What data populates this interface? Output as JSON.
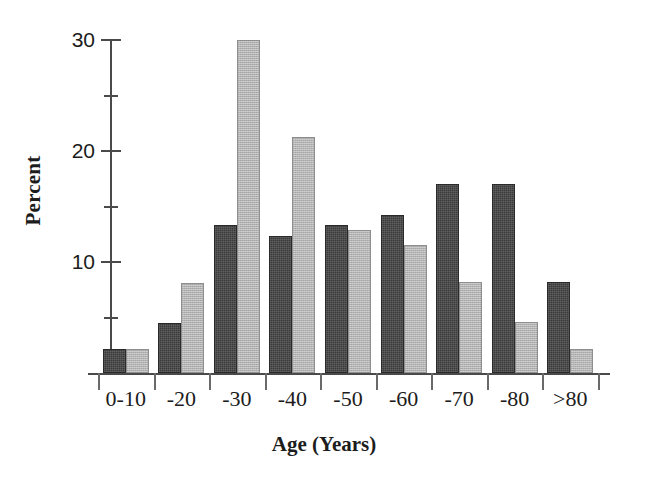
{
  "chart_data": {
    "type": "bar",
    "title": "",
    "xlabel": "Age (Years)",
    "ylabel": "Percent",
    "categories": [
      "0-10",
      "-20",
      "-30",
      "-40",
      "-50",
      "-60",
      "-70",
      "-80",
      ">80"
    ],
    "series": [
      {
        "name": "dark",
        "color": "#3b3b3b",
        "values": [
          2.2,
          4.5,
          13.3,
          12.3,
          13.3,
          14.2,
          17.0,
          17.0,
          8.2
        ]
      },
      {
        "name": "light",
        "color": "#b3b3b3",
        "values": [
          2.2,
          8.1,
          30.0,
          21.3,
          12.9,
          11.5,
          8.2,
          4.6,
          2.2
        ]
      }
    ],
    "ylim": [
      0,
      30
    ],
    "yticks": [
      10,
      20,
      30
    ],
    "ytick_labels": [
      "10",
      "20",
      "30"
    ],
    "yminor_ticks": [
      5,
      15,
      25
    ],
    "grid": false,
    "legend": "none"
  }
}
